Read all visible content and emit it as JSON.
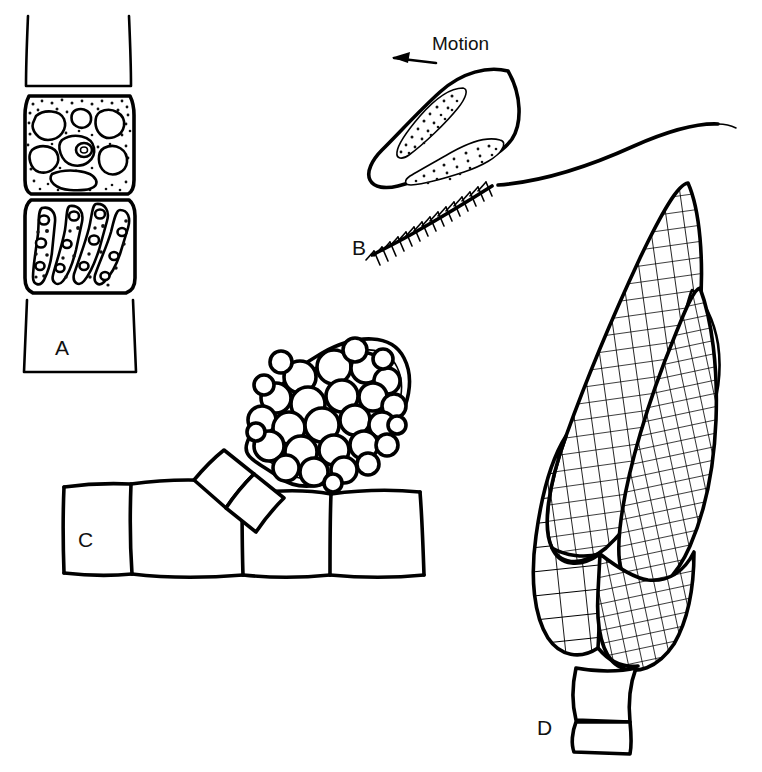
{
  "figure": {
    "background_color": "#ffffff",
    "ink_color": "#000000",
    "width": 762,
    "height": 772,
    "style": "black-and-white line drawing"
  },
  "annotations": {
    "motion_label": "Motion",
    "motion_arrow_direction": "left"
  },
  "panels": [
    {
      "id": "A",
      "label": "A",
      "label_x": 55,
      "label_y": 348,
      "subject": "filament with two fertile cells",
      "description": "Vertical uniseriate filament; upper fertile cell densely stippled with pale vacuoles and a central ringed organelle; lower cell with four elongate ribbon chloroplasts bearing pyrenoids; empty vegetative cells above and below.",
      "vacuole_count": 7,
      "chloroplast_band_count": 4
    },
    {
      "id": "B",
      "label": "B",
      "label_x": 352,
      "label_y": 248,
      "subject": "biflagellate zoospore",
      "description": "Pear-shaped swimming zoospore bearing two stippled plastid bands; anterior tinsel flagellum with lateral mastigonemes directed down-left; posterior smooth whiplash flagellum trailing to the right.",
      "mastigoneme_pairs": 16,
      "plastid_band_count": 2,
      "flagella": [
        "tinsel (pleuronematic)",
        "whiplash (smooth)"
      ]
    },
    {
      "id": "C",
      "label": "C",
      "label_x": 78,
      "label_y": 540,
      "subject": "stalked sporangium on filament",
      "description": "Horizontal filament of four rectangular vegetative cells; an obliquely tilted double-walled ovoid sporangium packed with spherical spores is borne on a short two-celled stalk arising between cells.",
      "vegetative_cell_count": 4,
      "spore_count": 30,
      "stalk_cell_count": 2
    },
    {
      "id": "D",
      "label": "D",
      "label_x": 537,
      "label_y": 728,
      "subject": "plurilocular sporangium",
      "description": "Large elongate plurilocular sporangium composed of several lobes divided into a fine grid of rectangular locules; borne on a short two-celled stalk.",
      "lobe_count": 5,
      "stalk_cell_count": 2
    }
  ]
}
